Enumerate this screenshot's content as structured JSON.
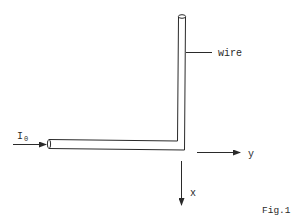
{
  "figure": {
    "caption": "Fig.1",
    "wire_label": "wire",
    "current_label": "I",
    "current_subscript": "0",
    "axis_y_label": "y",
    "axis_x_label": "x"
  },
  "colors": {
    "background": "#ffffff",
    "ink": "#2a2a2a"
  }
}
